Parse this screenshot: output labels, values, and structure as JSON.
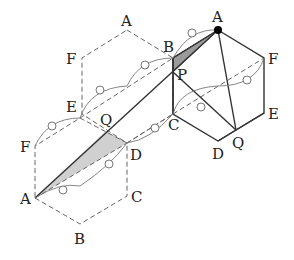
{
  "figure": {
    "type": "geometry-net",
    "colors": {
      "line": "#333333",
      "dashed": "#666666",
      "shade": "#bbbbbb",
      "dot": "#000000"
    }
  },
  "labels": {
    "middle_hex": {
      "A": "A",
      "F": "F",
      "E": "E",
      "B": "B",
      "C": "C",
      "D": "D"
    },
    "left_hex": {
      "F": "F",
      "A": "A",
      "B": "B",
      "C": "C",
      "D": "D",
      "E": "E"
    },
    "right_hex": {
      "A": "A",
      "F": "F",
      "E": "E",
      "D": "D",
      "Q": "Q",
      "P": "P"
    },
    "Q_left": "Q"
  }
}
